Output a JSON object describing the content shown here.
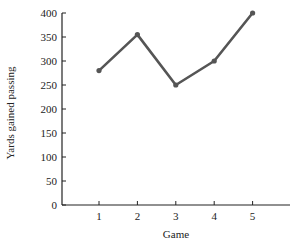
{
  "chart_data": {
    "type": "line",
    "title": "",
    "xlabel": "Game",
    "ylabel": "Yards gained passing",
    "categories": [
      "1",
      "2",
      "3",
      "4",
      "5"
    ],
    "x": [
      1,
      2,
      3,
      4,
      5
    ],
    "values": [
      280,
      355,
      250,
      300,
      400
    ],
    "ylim": [
      0,
      400
    ],
    "yticks": [
      0,
      50,
      100,
      150,
      200,
      250,
      300,
      350,
      400
    ],
    "xticks": [
      1,
      2,
      3,
      4,
      5
    ],
    "grid": false,
    "legend": null,
    "line_color": "#555555"
  }
}
